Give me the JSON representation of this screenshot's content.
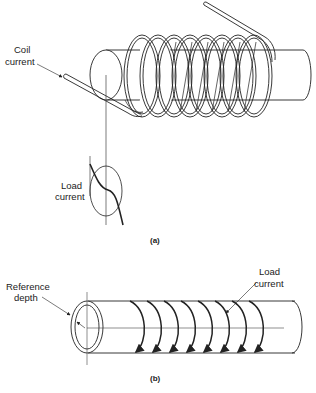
{
  "figure_a": {
    "caption": "(a)",
    "labels": {
      "coil_current_line1": "Coil",
      "coil_current_line2": "current",
      "load_current_line1": "Load",
      "load_current_line2": "current"
    },
    "coil_turns": 8
  },
  "figure_b": {
    "caption": "(b)",
    "labels": {
      "reference_depth_line1": "Reference",
      "reference_depth_line2": "depth",
      "load_current_line1": "Load",
      "load_current_line2": "current"
    },
    "current_arrows": 8
  },
  "colors": {
    "line": "#222222",
    "background": "#ffffff"
  }
}
